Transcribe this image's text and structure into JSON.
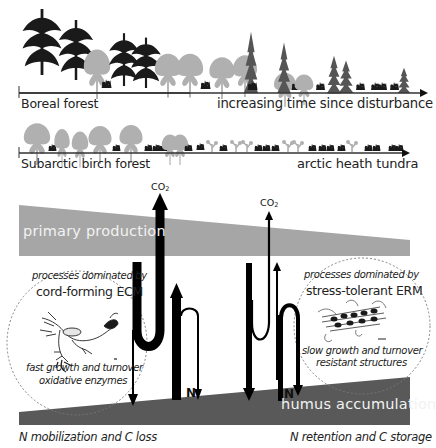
{
  "succession": {
    "boreal_row": {
      "left_label": "Boreal forest",
      "right_label": "increasing time since disturbance"
    },
    "subarctic_row": {
      "left_label": "Subarctic birch forest",
      "right_label": "arctic heath tundra"
    }
  },
  "bands": {
    "primary_production": {
      "label": "primary production",
      "color": "#a6a6a6"
    },
    "humus_accumulation": {
      "label": "humus accumulation",
      "color": "#595959"
    }
  },
  "flux_labels": {
    "co2_left": "CO",
    "co2_left_sub": "2",
    "co2_right": "CO",
    "co2_right_sub": "2",
    "n_left": "N",
    "n_right": "N"
  },
  "left_panel": {
    "intro": "processes dominated by",
    "title": "cord-forming ECM",
    "trait_1": "fast growth and turnover",
    "trait_2": "oxidative enzymes",
    "outcome": "N mobilization and C loss"
  },
  "right_panel": {
    "intro": "processes dominated by",
    "title": "stress-tolerant ERM",
    "trait_1": "slow growth and turnover",
    "trait_2": "resistant structures",
    "outcome": "N retention and C storage"
  },
  "colors": {
    "tree_dark": "#1a1a1a",
    "tree_light": "#a8a8a8",
    "arrow": "#000000",
    "dashed_circle": "#777777"
  }
}
